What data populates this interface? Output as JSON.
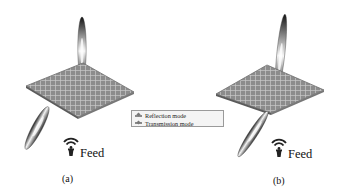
{
  "figure": {
    "panels": [
      {
        "id": "a",
        "label": "(a)",
        "feed_label": "Feed",
        "mode": "transmission-and-reflection",
        "beams": [
          "upward",
          "downward-tilted"
        ]
      },
      {
        "id": "b",
        "label": "(b)",
        "feed_label": "Feed",
        "mode": "transmission-and-reflection",
        "beams": [
          "upward-tilted",
          "downward-tilted"
        ]
      }
    ],
    "legend": {
      "items": [
        {
          "label": "Reflection mode",
          "marker": "arrow-diamond"
        },
        {
          "label": "Transmission mode",
          "marker": "arrow-diamond"
        }
      ]
    },
    "colors": {
      "plate": "#8c8c8c",
      "grid": "#c9c9c9",
      "beam_dark": "#1a1a1a",
      "beam_light": "#f2f2f2",
      "legend_border": "#9a9a9a"
    },
    "icons": [
      "feed-antenna-icon"
    ]
  }
}
